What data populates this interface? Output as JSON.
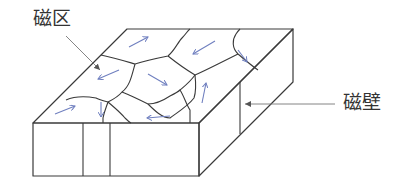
{
  "labels": {
    "magnetic_domain": "磁区",
    "domain_wall": "磁壁"
  },
  "colors": {
    "edge": "#3a3a3a",
    "arrow": "#6f7fbf",
    "leader": "#777777",
    "text": "#333333"
  },
  "figure": {
    "domain_arrow_directions": [
      "up-right",
      "down-left",
      "down-right",
      "down-left",
      "down-right",
      "up",
      "up-right",
      "down",
      "left"
    ]
  }
}
